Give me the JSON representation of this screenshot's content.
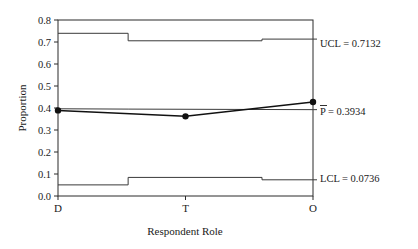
{
  "chart_data": {
    "type": "line",
    "title": "",
    "subtitle": "",
    "xlabel": "Respondent Role",
    "ylabel": "Proportion",
    "categories": [
      "D",
      "T",
      "O"
    ],
    "series": [
      {
        "name": "Proportion",
        "values": [
          0.389,
          0.362,
          0.427
        ]
      }
    ],
    "ylim": [
      0.0,
      0.8
    ],
    "ytick_labels": [
      "0.8",
      "0.7",
      "0.6",
      "0.5",
      "0.4",
      "0.3",
      "0.2",
      "0.1",
      "0.0"
    ],
    "ytick_values": [
      0.8,
      0.7,
      0.6,
      0.5,
      0.4,
      0.3,
      0.2,
      0.1,
      0.0
    ],
    "grid": false,
    "legend": "none",
    "center_line": {
      "label": "P̄ = 0.3934",
      "symbol": "P",
      "value": 0.3934,
      "segment_values": [
        0.3965,
        0.395,
        0.3925
      ]
    },
    "upper_control_limit": {
      "label": "UCL = 0.7132",
      "value": 0.7132,
      "stepped": true,
      "segment_values": [
        0.7395,
        0.7055,
        0.7132
      ]
    },
    "lower_control_limit": {
      "label": "LCL = 0.0736",
      "value": 0.0736,
      "stepped": true,
      "segment_values": [
        0.0505,
        0.0845,
        0.0736
      ]
    },
    "step_breaks": [
      0.275,
      0.8
    ]
  },
  "annotations": {
    "ucl": "UCL = 0.7132",
    "center": " = 0.3934",
    "center_symbol": "P",
    "lcl": "LCL = 0.0736"
  },
  "axes": {
    "y_title": "Proportion",
    "x_title": "Respondent Role",
    "y_ticks": [
      "0.8",
      "0.7",
      "0.6",
      "0.5",
      "0.4",
      "0.3",
      "0.2",
      "0.1",
      "0.0"
    ],
    "x_ticks": [
      "D",
      "T",
      "O"
    ]
  }
}
